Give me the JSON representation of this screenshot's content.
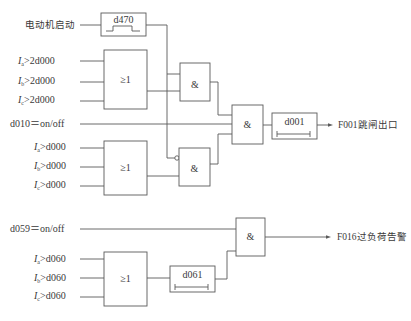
{
  "diagram": {
    "type": "logic-diagram",
    "inputs": {
      "motor_start": "电动机启动",
      "ia_2d000": {
        "var": "I",
        "sub": "a",
        "cond": ">2d000"
      },
      "ib_2d000": {
        "var": "I",
        "sub": "b",
        "cond": ">2d000"
      },
      "ic_2d000": {
        "var": "I",
        "sub": "c",
        "cond": ">2d000"
      },
      "d010": "d010＝on/off",
      "ia_d000": {
        "var": "I",
        "sub": "a",
        "cond": ">d000"
      },
      "ib_d000": {
        "var": "I",
        "sub": "b",
        "cond": ">d000"
      },
      "ic_d000": {
        "var": "I",
        "sub": "c",
        "cond": ">d000"
      },
      "d059": "d059＝on/off",
      "ia_d060": {
        "var": "I",
        "sub": "a",
        "cond": ">d060"
      },
      "ib_d060": {
        "var": "I",
        "sub": "b",
        "cond": ">d060"
      },
      "ic_d060": {
        "var": "I",
        "sub": "c",
        "cond": ">d060"
      }
    },
    "blocks": {
      "pulse_d470": "d470",
      "or_1": "≥1",
      "and_1": "&",
      "or_2": "≥1",
      "and_2": "&",
      "and_3": "&",
      "timer_d001": "d001",
      "and_4": "&",
      "or_3": "≥1",
      "timer_d061": "d061"
    },
    "outputs": {
      "f001": "F001跳闸出口",
      "f016": "F016过负荷告警"
    },
    "colors": {
      "line": "#5a5a5a",
      "text": "#3a3a3a",
      "background": "#ffffff"
    }
  }
}
